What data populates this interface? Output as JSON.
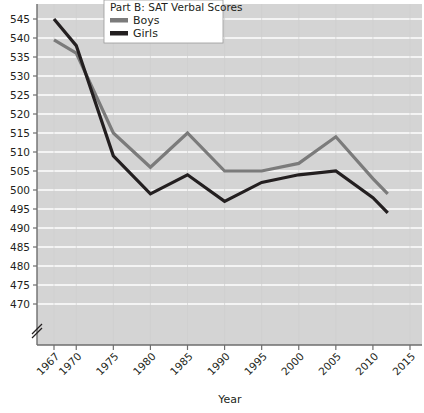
{
  "chart_data": {
    "type": "line",
    "title": "Part B: SAT Verbal Scores",
    "xlabel": "Year",
    "ylabel": "",
    "x": [
      1967,
      1970,
      1975,
      1980,
      1985,
      1990,
      1995,
      2000,
      2005,
      2010,
      2012
    ],
    "xtick_labels": [
      "1967",
      "1970",
      "1975",
      "1980",
      "1985",
      "1990",
      "1995",
      "2000",
      "2005",
      "2010",
      "2015"
    ],
    "xtick_values": [
      1967,
      1970,
      1975,
      1980,
      1985,
      1990,
      1995,
      2000,
      2005,
      2010,
      2015
    ],
    "ytick_labels": [
      "545",
      "540",
      "535",
      "530",
      "525",
      "520",
      "515",
      "510",
      "505",
      "500",
      "495",
      "490",
      "485",
      "480",
      "475",
      "470"
    ],
    "ytick_values": [
      545,
      540,
      535,
      530,
      525,
      520,
      515,
      510,
      505,
      500,
      495,
      490,
      485,
      480,
      475,
      470
    ],
    "ylim": [
      467,
      547
    ],
    "xlim": [
      1966,
      2016
    ],
    "axis_break": true,
    "grid": true,
    "grid_color": "#ffffff",
    "plot_background": "#d4d4d4",
    "legend_position": "top-center",
    "series": [
      {
        "name": "Boys",
        "color": "#7b7b7b",
        "values": [
          539.5,
          536,
          515,
          506,
          515,
          505,
          505,
          507,
          514,
          503,
          499
        ]
      },
      {
        "name": "Girls",
        "color": "#231f20",
        "values": [
          545,
          538,
          509,
          499,
          504,
          497,
          502,
          504,
          505,
          498,
          494
        ]
      }
    ]
  },
  "legend": {
    "title": "Part B: SAT Verbal Scores",
    "entries": [
      {
        "label": "Boys",
        "color": "#7b7b7b"
      },
      {
        "label": "Girls",
        "color": "#231f20"
      }
    ]
  },
  "axes": {
    "x_title": "Year",
    "break_symbol": "//"
  }
}
